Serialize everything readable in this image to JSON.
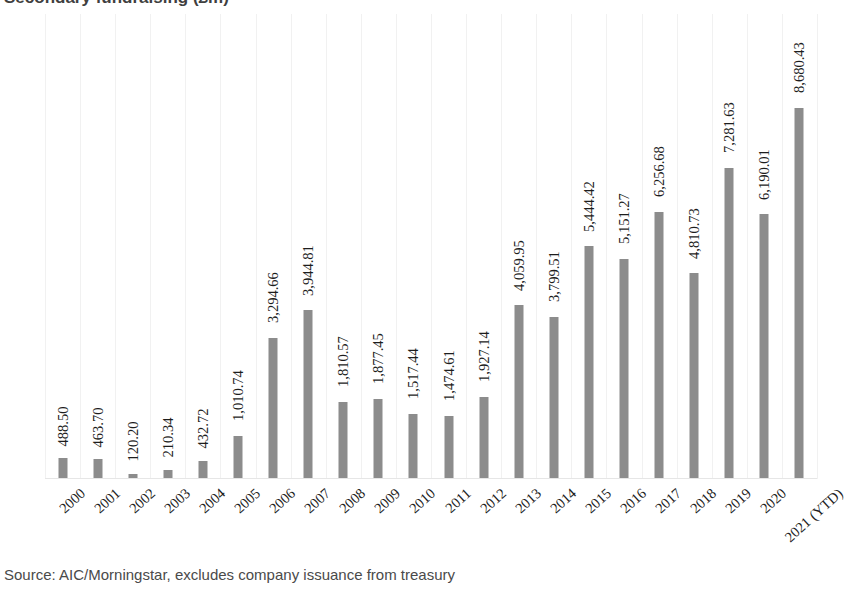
{
  "chart_data": {
    "type": "bar",
    "title": "Secondary fundraising (£m)",
    "xlabel": "",
    "ylabel": "",
    "ylim": [
      0,
      9000
    ],
    "grid": "vertical-faint",
    "legend": null,
    "bar_color": "#8c8c8c",
    "categories": [
      "2000",
      "2001",
      "2002",
      "2003",
      "2004",
      "2005",
      "2006",
      "2007",
      "2008",
      "2009",
      "2010",
      "2011",
      "2012",
      "2013",
      "2014",
      "2015",
      "2016",
      "2017",
      "2018",
      "2019",
      "2020",
      "2021 (YTD)"
    ],
    "values": [
      488.5,
      463.7,
      120.2,
      210.34,
      432.72,
      1010.74,
      3294.66,
      3944.81,
      1810.57,
      1877.45,
      1517.44,
      1474.61,
      1927.14,
      4059.95,
      3799.51,
      5444.42,
      5151.27,
      6256.68,
      4810.73,
      7281.63,
      6190.01,
      8680.43
    ],
    "value_labels": [
      "488.50",
      "463.70",
      "120.20",
      "210.34",
      "432.72",
      "1,010.74",
      "3,294.66",
      "3,944.81",
      "1,810.57",
      "1,877.45",
      "1,517.44",
      "1,474.61",
      "1,927.14",
      "4,059.95",
      "3,799.51",
      "5,444.42",
      "5,151.27",
      "6,256.68",
      "4,810.73",
      "7,281.63",
      "6,190.01",
      "8,680.43"
    ]
  },
  "footer": {
    "source": "Source: AIC/Morningstar, excludes company issuance from treasury"
  }
}
